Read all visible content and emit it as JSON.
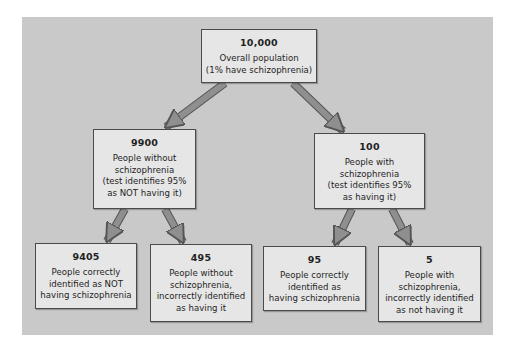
{
  "diagram": {
    "type": "probability-tree",
    "colors": {
      "background": "#ffffff",
      "panel": "#c9c9c9",
      "box_fill": "#e6e6e6",
      "box_border": "#4a4a4a",
      "arrow_fill": "#8f8f8f",
      "arrow_border": "#555555",
      "text": "#1f1f1f"
    },
    "root": {
      "count": "10,000",
      "lines": [
        "Overall population",
        "(1% have schizophrenia)"
      ]
    },
    "level2": {
      "without": {
        "count": "9900",
        "lines": [
          "People without",
          "schizophrenia",
          "(test identifies 95%",
          "as NOT having it)"
        ]
      },
      "with": {
        "count": "100",
        "lines": [
          "People with",
          "schizophrenia",
          "(test identifies 95%",
          "as having it)"
        ]
      }
    },
    "level3": {
      "true_negative": {
        "count": "9405",
        "lines": [
          "People correctly",
          "identified as NOT",
          "having schizophrenia"
        ]
      },
      "false_positive": {
        "count": "495",
        "lines": [
          "People without",
          "schizophrenia,",
          "incorrectly identified",
          "as having it"
        ]
      },
      "true_positive": {
        "count": "95",
        "lines": [
          "People correctly",
          "identified as",
          "having schizophrenia"
        ]
      },
      "false_negative": {
        "count": "5",
        "lines": [
          "People with",
          "schizophrenia,",
          "incorrectly identified",
          "as not having it"
        ]
      }
    }
  }
}
